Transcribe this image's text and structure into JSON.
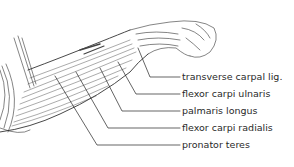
{
  "figure": {
    "labels": [
      {
        "text": "transverse carpal lig.",
        "y": 71
      },
      {
        "text": "flexor carpi ulnaris",
        "y": 88
      },
      {
        "text": "palmaris longus",
        "y": 105
      },
      {
        "text": "flexor carpi radialis",
        "y": 122
      },
      {
        "text": "pronator teres",
        "y": 139
      }
    ]
  }
}
